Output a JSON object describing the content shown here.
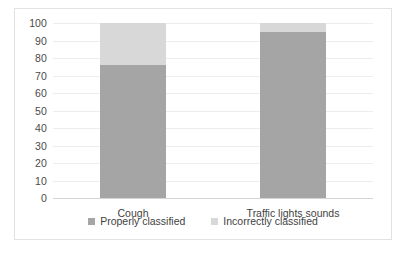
{
  "chart_data": {
    "type": "bar",
    "subtype": "stacked-bar",
    "title": "",
    "xlabel": "",
    "ylabel": "",
    "categories": [
      "Cough",
      "Traffic lights sounds"
    ],
    "series": [
      {
        "name": "Properly classified",
        "values": [
          76,
          95
        ],
        "color": "#a5a5a5"
      },
      {
        "name": "Incorrectly classified",
        "values": [
          24,
          5
        ],
        "color": "#d8d8d8"
      }
    ],
    "ylim": [
      0,
      100
    ],
    "yticks": [
      100,
      90,
      80,
      70,
      60,
      50,
      40,
      30,
      20,
      10,
      0
    ],
    "ytick_labels": [
      "100",
      "90",
      "80",
      "70",
      "60",
      "50",
      "40",
      "30",
      "20",
      "10",
      "0"
    ],
    "grid": true,
    "legend_position": "bottom"
  },
  "legend": {
    "items": [
      {
        "label": "Properly classified",
        "color": "#a5a5a5"
      },
      {
        "label": "Incorrectly classified",
        "color": "#d8d8d8"
      }
    ]
  },
  "axis": {
    "y": {
      "labels": [
        "100",
        "90",
        "80",
        "70",
        "60",
        "50",
        "40",
        "30",
        "20",
        "10",
        "0"
      ]
    },
    "x": {
      "labels": [
        "Cough",
        "Traffic lights sounds"
      ]
    }
  }
}
